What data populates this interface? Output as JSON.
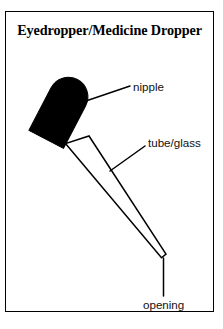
{
  "figure": {
    "title": "Eyedropper/Medicine Dropper",
    "background_color": "#ffffff",
    "ink_color": "#000000",
    "frame": {
      "border_color": "#000000",
      "border_width_px": 1.6
    }
  },
  "labels": {
    "nipple": "nipple",
    "tube_glass": "tube/glass",
    "opening": "opening"
  },
  "parts": [
    {
      "name": "nipple",
      "label": "nipple",
      "fill_color": "#000000",
      "shape": "rounded-capsule-bulb"
    },
    {
      "name": "tube-glass",
      "label": "tube/glass",
      "fill_color": "#ffffff",
      "stroke_color": "#000000",
      "shape": "tapered-glass-tube"
    },
    {
      "name": "opening",
      "label": "opening",
      "shape": "tube-tip-point"
    }
  ]
}
